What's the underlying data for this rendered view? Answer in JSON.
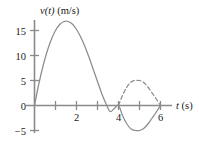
{
  "figure": {
    "background_color": "#ffffff",
    "curve_color": "#8c8c8c",
    "axis_color": "#8a8a8a",
    "text_color": "#1a1a1a"
  },
  "axes": {
    "y_title": "v(t) (m/s)",
    "y_title_var": "v(t)",
    "y_title_unit": "(m/s)",
    "x_title": "t (s)",
    "x_title_var": "t",
    "x_title_unit": "(s)",
    "y_tick_labels": [
      "15",
      "10",
      "5",
      "0",
      "-5"
    ],
    "y_tick_label_minus5": "−5",
    "x_tick_labels": [
      "2",
      "4",
      "6"
    ]
  },
  "chart_data": {
    "type": "line",
    "title": "",
    "xlabel": "t (s)",
    "ylabel": "v(t) (m/s)",
    "xlim": [
      0,
      6.6
    ],
    "ylim": [
      -6.5,
      17.5
    ],
    "xticks": [
      1,
      2,
      3,
      4,
      5,
      6
    ],
    "xticklabels": [
      "",
      "2",
      "",
      "4",
      "",
      "6"
    ],
    "yticks": [
      -5,
      0,
      5,
      10,
      15
    ],
    "yticklabels": [
      "−5",
      "0",
      "5",
      "10",
      "15"
    ],
    "grid": false,
    "legend": null,
    "series": [
      {
        "name": "velocity",
        "style": "solid",
        "color": "#8c8c8c",
        "x": [
          0,
          0.2,
          0.4,
          0.6,
          0.8,
          1.0,
          1.2,
          1.4,
          1.6,
          1.8,
          2.0,
          2.2,
          2.4,
          2.6,
          2.8,
          3.0,
          3.2,
          3.4,
          3.6,
          3.8,
          4.0,
          4.2,
          4.4,
          4.6,
          4.8,
          5.0,
          5.2,
          5.4,
          5.6,
          5.8,
          6.0
        ],
        "y": [
          0,
          4.2,
          7.8,
          10.8,
          13.2,
          15.0,
          16.2,
          16.8,
          16.8,
          16.3,
          15.2,
          13.7,
          11.8,
          9.6,
          7.2,
          4.8,
          2.4,
          0.4,
          -1.2,
          -0.6,
          0.0,
          -2.1,
          -3.7,
          -4.7,
          -5.0,
          -5.0,
          -4.6,
          -3.7,
          -2.5,
          -1.3,
          0.0
        ]
      },
      {
        "name": "velocity-reflected",
        "style": "dashed",
        "color": "#8c8c8c",
        "x": [
          4.0,
          4.2,
          4.4,
          4.6,
          4.8,
          5.0,
          5.2,
          5.4,
          5.6,
          5.8,
          6.0
        ],
        "y": [
          0.0,
          2.1,
          3.7,
          4.7,
          5.0,
          5.0,
          4.6,
          3.7,
          2.5,
          1.3,
          0.0
        ]
      }
    ],
    "annotations": [
      {
        "text": "peak",
        "x": 1.7,
        "y": 16.8
      },
      {
        "text": "zero-crossing",
        "x": 4.0,
        "y": 0.0
      },
      {
        "text": "minimum",
        "x": 5.0,
        "y": -5.0
      },
      {
        "text": "end",
        "x": 6.0,
        "y": 0.0
      }
    ]
  }
}
